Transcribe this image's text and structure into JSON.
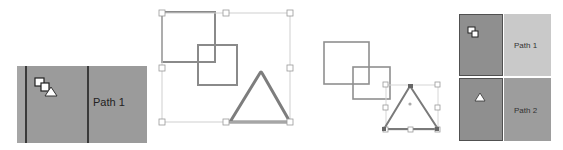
{
  "panel_layer_single": {
    "label": "Path 1",
    "thumbnail_icon": "squares-and-triangle-icon"
  },
  "panel_canvas_grouped": {
    "selection": "all shapes",
    "shapes": [
      "square",
      "square",
      "triangle"
    ]
  },
  "panel_canvas_separate": {
    "selection": "triangle",
    "shapes": [
      "square",
      "square",
      "triangle"
    ]
  },
  "panel_layers_list": {
    "rows": [
      {
        "label": "Path 1",
        "thumbnail_icon": "two-squares-icon",
        "selected": true
      },
      {
        "label": "Path 2",
        "thumbnail_icon": "triangle-icon",
        "selected": false
      }
    ]
  },
  "colors": {
    "layer_bg": "#9b9b9b",
    "layer_selected_bg": "#c9c9c9",
    "thumb_cell_bg": "#8f8f8f",
    "shape_stroke": "#8a8a8a",
    "selection_box": "#c8c8c8"
  }
}
